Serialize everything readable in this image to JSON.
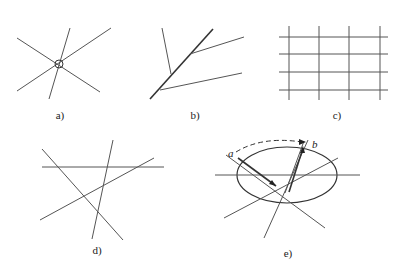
{
  "panels": [
    {
      "id": "a",
      "label": "a)",
      "description": "Lines intersecting at a common point (circled)"
    },
    {
      "id": "b",
      "label": "b)",
      "description": "Lines branching off a main line"
    },
    {
      "id": "c",
      "label": "c)",
      "description": "Orthogonal grid of lines"
    },
    {
      "id": "d",
      "label": "d)",
      "description": "Randomly intersecting lines"
    },
    {
      "id": "e",
      "label": "e)",
      "description": "Lines through ellipse with rotation from a to b"
    }
  ],
  "annotations": {
    "e_start": "a",
    "e_end": "b"
  },
  "colors": {
    "line": "#555555",
    "background": "#ffffff"
  }
}
